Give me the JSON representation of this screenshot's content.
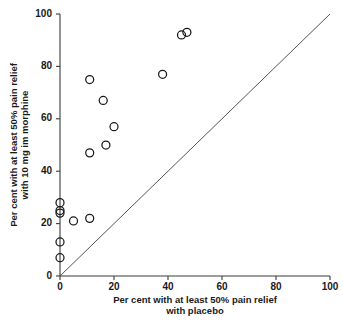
{
  "chart_data": {
    "type": "scatter",
    "title": "",
    "xlabel": "Per cent with at least 50% pain relief with placebo",
    "xlabel_line1": "Per cent with at least 50% pain relief",
    "xlabel_line2": "with placebo",
    "ylabel": "Per cent with at least 50% pain relief with 10 mg im morphine",
    "ylabel_line1": "Per cent with at least 50% pain relief",
    "ylabel_line2": "with 10 mg im morphine",
    "xlim": [
      0,
      100
    ],
    "ylim": [
      0,
      100
    ],
    "xticks": [
      0,
      20,
      40,
      60,
      80,
      100
    ],
    "yticks": [
      0,
      20,
      40,
      60,
      80,
      100
    ],
    "xtick_labels": [
      "0",
      "20",
      "40",
      "60",
      "80",
      "100"
    ],
    "ytick_labels": [
      "0",
      "20",
      "40",
      "60",
      "80",
      "100"
    ],
    "grid": false,
    "legend": false,
    "marker": "open-circle",
    "marker_color": "#1a1a1a",
    "points": [
      {
        "x": 0,
        "y": 28
      },
      {
        "x": 0,
        "y": 25
      },
      {
        "x": 0,
        "y": 24
      },
      {
        "x": 0,
        "y": 13
      },
      {
        "x": 0,
        "y": 7
      },
      {
        "x": 5,
        "y": 21
      },
      {
        "x": 11,
        "y": 22
      },
      {
        "x": 11,
        "y": 47
      },
      {
        "x": 11,
        "y": 75
      },
      {
        "x": 16,
        "y": 67
      },
      {
        "x": 17,
        "y": 50
      },
      {
        "x": 20,
        "y": 57
      },
      {
        "x": 38,
        "y": 77
      },
      {
        "x": 45,
        "y": 92
      },
      {
        "x": 47,
        "y": 93
      }
    ],
    "reference_line": {
      "name": "line-of-equality",
      "from": [
        0,
        0
      ],
      "to": [
        100,
        100
      ],
      "color": "#555555"
    }
  }
}
